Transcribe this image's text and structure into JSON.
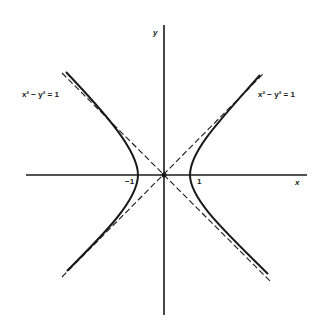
{
  "diagram": {
    "axes": {
      "x_label": "x",
      "y_label": "y"
    },
    "ticks": {
      "neg_one": "−1",
      "one": "1"
    },
    "labels": {
      "left_equation": "x² − y² = 1",
      "right_equation": "x² − y² = 1"
    },
    "curve": {
      "equation": "x^2 - y^2 = 1",
      "vertices": [
        [
          -1,
          0
        ],
        [
          1,
          0
        ]
      ],
      "asymptotes": [
        "y = x",
        "y = -x"
      ]
    },
    "colors": {
      "ink": "#1a1a1a",
      "background": "#ffffff"
    }
  }
}
